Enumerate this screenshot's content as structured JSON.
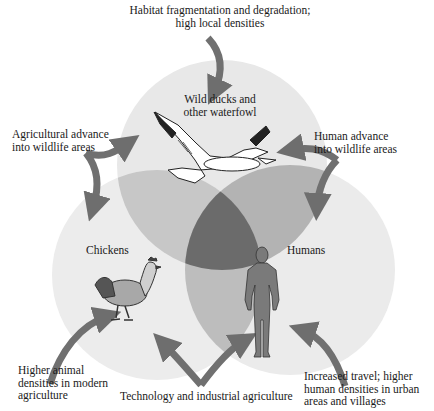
{
  "diagram": {
    "type": "venn-3",
    "colors": {
      "circle_fill": "#e6e6e6",
      "overlap_two": "#b9b9b9",
      "overlap_three": "#6b6b6b",
      "arrow": "#6e6e6e",
      "human_silhouette": "#7a7a7a",
      "background": "#ffffff"
    },
    "circles": [
      {
        "id": "wild",
        "label_line1": "Wild ducks and",
        "label_line2": "other waterfowl",
        "icon": "goose-icon"
      },
      {
        "id": "chickens",
        "label": "Chickens",
        "icon": "chicken-icon"
      },
      {
        "id": "humans",
        "label": "Humans",
        "icon": "human-icon"
      }
    ],
    "drivers": {
      "top": {
        "line1": "Habitat fragmentation and degradation;",
        "line2": "high local densities"
      },
      "upper_left": {
        "line1": "Agricultural advance",
        "line2": "into wildlife areas"
      },
      "upper_right": {
        "line1": "Human advance",
        "line2": "into wildlife areas"
      },
      "lower_left": {
        "line1": "Higher animal",
        "line2": "densities in modern",
        "line3": "agriculture"
      },
      "bottom_center": {
        "line1": "Technology and industrial agriculture"
      },
      "lower_right": {
        "line1": "Increased travel; higher",
        "line2": "human densities in urban",
        "line3": "areas and villages"
      }
    }
  }
}
